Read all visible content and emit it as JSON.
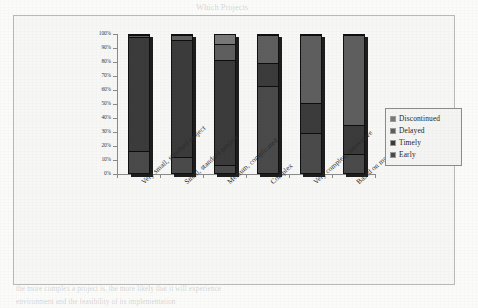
{
  "chart_data": {
    "type": "bar",
    "subtype": "100% stacked column",
    "title": "",
    "xlabel": "",
    "ylabel": "",
    "ylim": [
      0,
      100
    ],
    "grid": false,
    "legend_position": "right",
    "categories": [
      "Very small, standard project",
      "Small, standard project",
      "Medium, complicated",
      "Complex",
      "Very complex, innovative",
      "Based on modern technology"
    ],
    "ytick_labels": [
      "100%",
      "90%",
      "80%",
      "70%",
      "60%",
      "50%",
      "40%",
      "30%",
      "20%",
      "10%",
      "0%"
    ],
    "ytick_values": [
      100,
      90,
      80,
      70,
      60,
      50,
      40,
      30,
      20,
      10,
      0
    ],
    "series": [
      {
        "name": "Discontinued",
        "color": "#787878",
        "values": [
          1,
          1,
          7,
          1,
          1,
          1
        ]
      },
      {
        "name": "Delayed",
        "color": "#5e5e5e",
        "values": [
          1,
          3,
          12,
          20,
          49,
          65
        ]
      },
      {
        "name": "Timely",
        "color": "#3b3b3b",
        "values": [
          83,
          85,
          76,
          17,
          22,
          21
        ]
      },
      {
        "name": "Early",
        "color": "#4a4a4a",
        "values": [
          15,
          11,
          5,
          62,
          28,
          13
        ]
      }
    ],
    "stack_boundaries_percent": [
      [
        15,
        98,
        99
      ],
      [
        11,
        96,
        99
      ],
      [
        5,
        81,
        93
      ],
      [
        62,
        79,
        99
      ],
      [
        28,
        50,
        99
      ],
      [
        13,
        34,
        99
      ]
    ]
  },
  "legend": {
    "items": [
      {
        "label": "Discontinued",
        "color": "#787878"
      },
      {
        "label": "Delayed",
        "color": "#5e5e5e"
      },
      {
        "label": "Timely",
        "color": "#3b3b3b"
      },
      {
        "label": "Early",
        "color": "#4a4a4a"
      }
    ]
  },
  "background_text": {
    "top_header": "Which Projects",
    "line_a": "may contain between the project and the",
    "line_b": "complexity of an environment; the more",
    "line_c": "likely that it will experience a risk of",
    "line_d": "Introduction",
    "line_e": "Empirical research shows that there is a relationship between the type",
    "line_f": "the more complex a project is, the more likely that it will experience",
    "line_g": "environment and the feasibility of its implementation"
  }
}
